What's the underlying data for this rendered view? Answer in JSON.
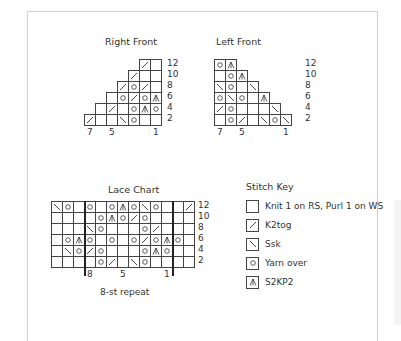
{
  "charts": {
    "right_front": {
      "title": "Right Front",
      "cols": 7,
      "align": "right",
      "row_labels": [
        "12",
        "10",
        "8",
        "6",
        "4",
        "2"
      ],
      "col_labels": [
        {
          "text": "7",
          "col": 7
        },
        {
          "text": "5",
          "col": 5
        },
        {
          "text": "1",
          "col": 1
        }
      ],
      "rows": [
        [
          "/",
          ""
        ],
        [
          "/",
          "",
          ""
        ],
        [
          "/",
          "O",
          "/",
          ""
        ],
        [
          "",
          "O",
          "/",
          "O",
          "A"
        ],
        [
          "",
          "/",
          "",
          "O",
          "A",
          "O"
        ],
        [
          "/",
          "",
          "",
          "\\",
          "O",
          "",
          ""
        ]
      ]
    },
    "left_front": {
      "title": "Left Front",
      "cols": 7,
      "align": "left",
      "row_labels": [
        "12",
        "10",
        "8",
        "6",
        "4",
        "2"
      ],
      "col_labels": [
        {
          "text": "7",
          "col": 7
        },
        {
          "text": "5",
          "col": 5
        },
        {
          "text": "1",
          "col": 1
        }
      ],
      "rows": [
        [
          "O",
          "A"
        ],
        [
          "",
          "O",
          "A"
        ],
        [
          "\\",
          "O",
          "",
          "\\"
        ],
        [
          "O",
          "\\",
          "O",
          "",
          "A"
        ],
        [
          "/",
          "O",
          "",
          "",
          "",
          "\\"
        ],
        [
          "",
          "O",
          "/",
          "",
          "\\",
          "O",
          "\\"
        ]
      ]
    },
    "lace": {
      "title": "Lace Chart",
      "cols": 13,
      "row_labels": [
        "12",
        "10",
        "8",
        "6",
        "4",
        "2"
      ],
      "col_labels": [
        {
          "text": "8",
          "index": 3
        },
        {
          "text": "5",
          "index": 6
        },
        {
          "text": "1",
          "index": 10
        }
      ],
      "repeat_label": "8-st repeat",
      "repeat_start_index": 3,
      "repeat_end_index": 11,
      "rows": [
        [
          "\\",
          "O",
          "",
          "O",
          "",
          "O",
          "A",
          "O",
          "\\",
          "O",
          "",
          "",
          "/"
        ],
        [
          "",
          "",
          "",
          "",
          "O",
          "A",
          "O",
          "/",
          "O",
          "",
          "",
          "",
          ""
        ],
        [
          "",
          "",
          "",
          "\\",
          "O",
          "",
          "",
          "",
          "O",
          "/",
          "",
          "",
          ""
        ],
        [
          "",
          "O",
          "A",
          "O",
          "",
          "O",
          "",
          "O",
          "/",
          "O",
          "A",
          "O",
          ""
        ],
        [
          "",
          "\\",
          "O",
          "/",
          "O",
          "",
          "",
          "",
          "O",
          "A",
          "O",
          "",
          ""
        ],
        [
          "",
          "",
          "",
          "",
          "O",
          "/",
          "",
          "\\",
          "O",
          "",
          "",
          "",
          ""
        ]
      ]
    }
  },
  "stitch_key": {
    "title": "Stitch Key",
    "items": [
      {
        "symbol": "",
        "label": "Knit 1 on RS, Purl 1 on WS"
      },
      {
        "symbol": "/",
        "label": "K2tog"
      },
      {
        "symbol": "\\",
        "label": "Ssk"
      },
      {
        "symbol": "O",
        "label": "Yarn over"
      },
      {
        "symbol": "A",
        "label": "S2KP2"
      }
    ]
  },
  "symbol_icons": {
    "/": "k2tog-icon",
    "\\": "ssk-icon",
    "O": "yarn-over-icon",
    "A": "s2kp2-icon",
    "": "knit-icon"
  },
  "colors": {
    "grid_line": "#444444",
    "frame": "#cfcfcf",
    "text": "#333333"
  }
}
